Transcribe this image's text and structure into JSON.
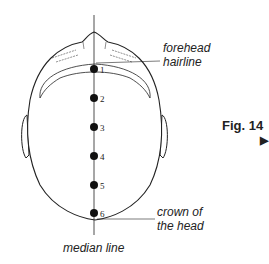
{
  "figure": {
    "label": "Fig. 14",
    "arrow": "▶",
    "points": [
      {
        "id": "1",
        "y": 69
      },
      {
        "id": "2",
        "y": 98
      },
      {
        "id": "3",
        "y": 127
      },
      {
        "id": "4",
        "y": 156
      },
      {
        "id": "5",
        "y": 185
      },
      {
        "id": "6",
        "y": 213
      }
    ],
    "labels": {
      "forehead": "forehead",
      "hairline": "hairline",
      "crown1": "crown of",
      "crown2": "the head",
      "median": "median line"
    }
  }
}
